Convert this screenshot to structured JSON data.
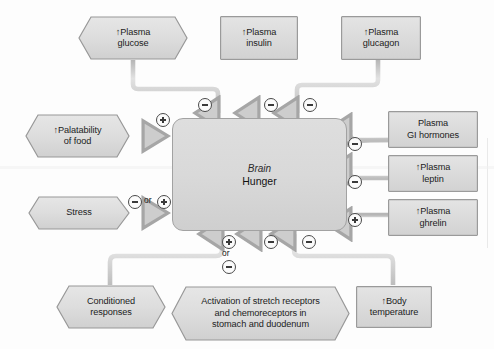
{
  "diagram": {
    "center": {
      "line1": "Brain",
      "line2": "Hunger"
    },
    "colors": {
      "node_fill": "#dcdcdc",
      "node_border": "#9a9a9a",
      "wire": "#c9c9c9",
      "wire_edge": "#a8a8a8",
      "text": "#1c1c1c",
      "background": "#fdfdfd"
    },
    "signs": {
      "plus": "+",
      "minus": "−",
      "or": "or"
    },
    "nodes": [
      {
        "id": "plasma-glucose",
        "shape": "hexagon",
        "lines": [
          "↑Plasma",
          "glucose"
        ],
        "sign": "minus",
        "position": "top-left"
      },
      {
        "id": "plasma-insulin",
        "shape": "rectangle",
        "lines": [
          "↑Plasma",
          "insulin"
        ],
        "sign": "minus",
        "position": "top-center"
      },
      {
        "id": "plasma-glucagon",
        "shape": "rectangle",
        "lines": [
          "↑Plasma",
          "glucagon"
        ],
        "sign": "minus",
        "position": "top-right"
      },
      {
        "id": "palatability-of-food",
        "shape": "hexagon",
        "lines": [
          "↑Palatability",
          "of food"
        ],
        "sign": "plus",
        "position": "left-upper"
      },
      {
        "id": "stress",
        "shape": "hexagon",
        "lines": [
          "Stress"
        ],
        "sign": "minus-or-plus",
        "position": "left-lower"
      },
      {
        "id": "plasma-gi-hormones",
        "shape": "rectangle",
        "lines": [
          "Plasma",
          "GI hormones"
        ],
        "sign": "minus",
        "position": "right-upper"
      },
      {
        "id": "plasma-leptin",
        "shape": "rectangle",
        "lines": [
          "↑Plasma",
          "leptin"
        ],
        "sign": "minus",
        "position": "right-middle"
      },
      {
        "id": "plasma-ghrelin",
        "shape": "rectangle",
        "lines": [
          "↑Plasma",
          "ghrelin"
        ],
        "sign": "plus",
        "position": "right-lower"
      },
      {
        "id": "conditioned-responses",
        "shape": "hexagon",
        "lines": [
          "Conditioned",
          "responses"
        ],
        "sign": "plus-or-minus",
        "position": "bottom-left"
      },
      {
        "id": "stretch-chemoreceptors",
        "shape": "hexagon",
        "lines": [
          "Activation of stretch receptors",
          "and chemoreceptors in",
          "stomach and duodenum"
        ],
        "sign": "minus",
        "position": "bottom-center"
      },
      {
        "id": "body-temperature",
        "shape": "rectangle",
        "lines": [
          "↑Body",
          "temperature"
        ],
        "sign": "minus",
        "position": "bottom-right"
      }
    ]
  }
}
